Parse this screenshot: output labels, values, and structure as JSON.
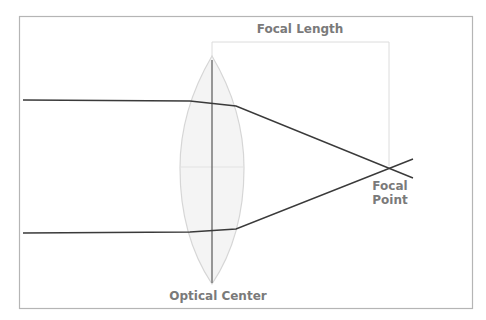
{
  "diagram": {
    "labels": {
      "focal_length": "Focal Length",
      "focal_point_line1": "Focal",
      "focal_point_line2": "Point",
      "optical_center": "Optical Center"
    },
    "colors": {
      "frame": "#b5b5b5",
      "ray": "#3a3a3a",
      "lens_outline": "#d6d6d6",
      "lens_fill": "#f4f4f4",
      "optical_axis": "#6e6e6e",
      "bracket": "#dcdcdc",
      "label": "#7a7a7a"
    }
  }
}
